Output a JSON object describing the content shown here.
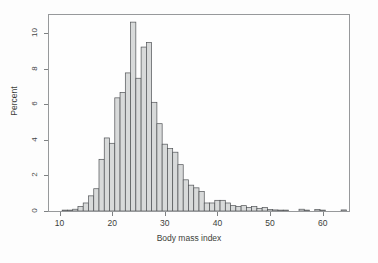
{
  "figure": {
    "background_color": "#ffffff",
    "frame_color": "#8a8d8f",
    "text_color": "#1d1f21"
  },
  "chart_data": {
    "type": "bar",
    "chart_subtype": "histogram",
    "title": "",
    "xlabel": "Body mass index",
    "ylabel": "Percent",
    "xlim": [
      8,
      65
    ],
    "ylim": [
      0,
      11
    ],
    "grid": false,
    "legend": null,
    "bin_width": 1,
    "bar_fill_color": "#d4d6d6",
    "bar_edge_color": "#3a3d40",
    "x_ticks": [
      10,
      20,
      30,
      40,
      50,
      60
    ],
    "x_tick_labels": [
      "10",
      "20",
      "30",
      "40",
      "50",
      "60"
    ],
    "y_ticks": [
      0,
      2,
      4,
      6,
      8,
      10
    ],
    "y_tick_labels": [
      "0",
      "2",
      "4",
      "6",
      "8",
      "10"
    ],
    "categories": [
      11,
      12,
      13,
      14,
      15,
      16,
      17,
      18,
      19,
      20,
      21,
      22,
      23,
      24,
      25,
      26,
      27,
      28,
      29,
      30,
      31,
      32,
      33,
      34,
      35,
      36,
      37,
      38,
      39,
      40,
      41,
      42,
      43,
      44,
      45,
      46,
      47,
      48,
      49,
      50,
      51,
      52,
      53,
      54,
      55,
      56,
      57,
      58,
      59,
      60,
      61,
      62,
      63,
      64
    ],
    "values": [
      0.05,
      0.05,
      0.1,
      0.25,
      0.45,
      0.85,
      1.25,
      2.9,
      4.1,
      3.8,
      6.35,
      6.65,
      7.75,
      10.6,
      7.45,
      9.2,
      9.45,
      6.1,
      4.9,
      3.75,
      3.5,
      3.3,
      2.6,
      1.75,
      1.45,
      1.3,
      1.1,
      0.45,
      0.45,
      0.6,
      0.6,
      0.45,
      0.3,
      0.25,
      0.3,
      0.2,
      0.25,
      0.15,
      0.2,
      0.08,
      0.06,
      0.05,
      0.05,
      0.0,
      0.0,
      0.1,
      0.05,
      0.0,
      0.08,
      0.05,
      0.0,
      0.0,
      0.0,
      0.06
    ],
    "series": [
      {
        "name": "Percent of subjects",
        "values": [
          0.05,
          0.05,
          0.1,
          0.25,
          0.45,
          0.85,
          1.25,
          2.9,
          4.1,
          3.8,
          6.35,
          6.65,
          7.75,
          10.6,
          7.45,
          9.2,
          9.45,
          6.1,
          4.9,
          3.75,
          3.5,
          3.3,
          2.6,
          1.75,
          1.45,
          1.3,
          1.1,
          0.45,
          0.45,
          0.6,
          0.6,
          0.45,
          0.3,
          0.25,
          0.3,
          0.2,
          0.25,
          0.15,
          0.2,
          0.08,
          0.06,
          0.05,
          0.05,
          0.0,
          0.0,
          0.1,
          0.05,
          0.0,
          0.08,
          0.05,
          0.0,
          0.0,
          0.0,
          0.06
        ]
      }
    ],
    "annotations": [],
    "peak_value": 10.6,
    "peak_category": 24
  }
}
